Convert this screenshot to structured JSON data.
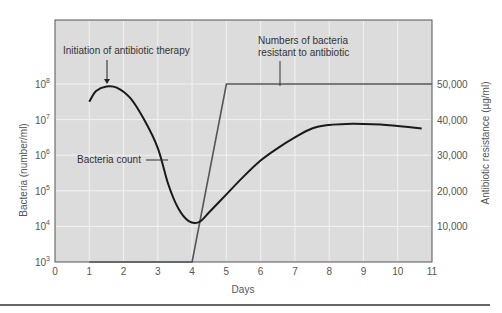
{
  "chart_data": {
    "type": "line",
    "title": "",
    "xlabel": "Days",
    "ylabel": "Bacteria (number/ml)",
    "ylabel_right": "Antibiotic resistance (µg/ml)",
    "x_ticks": [
      "0",
      "1",
      "2",
      "3",
      "4",
      "5",
      "6",
      "7",
      "8",
      "9",
      "10",
      "11"
    ],
    "xlim": [
      0,
      11
    ],
    "y_ticks_left": [
      {
        "base": "10",
        "exp": "3"
      },
      {
        "base": "10",
        "exp": "4"
      },
      {
        "base": "10",
        "exp": "5"
      },
      {
        "base": "10",
        "exp": "6"
      },
      {
        "base": "10",
        "exp": "7"
      },
      {
        "base": "10",
        "exp": "8"
      }
    ],
    "ylim_left_log10": [
      3,
      8
    ],
    "y_ticks_right": [
      "10,000",
      "20,000",
      "30,000",
      "40,000",
      "50,000"
    ],
    "ylim_right": [
      0,
      50000
    ],
    "grid": true,
    "series": [
      {
        "name": "Bacteria count",
        "axis": "left",
        "scale": "log10",
        "x": [
          1.0,
          1.2,
          1.5,
          1.8,
          2.2,
          2.6,
          3.0,
          3.3,
          3.6,
          3.9,
          4.2,
          4.5,
          5.0,
          5.5,
          6.0,
          6.5,
          7.0,
          7.5,
          8.0,
          8.5,
          9.0,
          9.5,
          10.0,
          10.7
        ],
        "log10_values": [
          7.5,
          7.8,
          7.93,
          7.9,
          7.6,
          7.0,
          6.2,
          5.2,
          4.5,
          4.15,
          4.12,
          4.4,
          4.9,
          5.4,
          5.85,
          6.2,
          6.5,
          6.75,
          6.85,
          6.88,
          6.88,
          6.86,
          6.82,
          6.75
        ]
      },
      {
        "name": "Numbers of bacteria resistant to antibiotic",
        "axis": "right",
        "x": [
          1,
          4,
          5,
          11
        ],
        "values": [
          0,
          0,
          50000,
          50000
        ]
      }
    ],
    "annotations": [
      {
        "text": "Initiation of antibiotic therapy",
        "x": 1.5,
        "arrow": true
      },
      {
        "text": "Bacteria count",
        "x": 3.3
      },
      {
        "text": "Numbers of bacteria resistant to antibiotic",
        "x": 5.9
      }
    ]
  },
  "labels": {
    "initiation": "Initiation of antibiotic therapy",
    "bacteria_count": "Bacteria count",
    "resistant_line1": "Numbers of bacteria",
    "resistant_line2": "resistant to antibiotic"
  },
  "colors": {
    "plot_bg": "#dcdcdc",
    "grid": "#f2f2f2",
    "curve": "#1a1a1a",
    "resistant": "#555555"
  }
}
